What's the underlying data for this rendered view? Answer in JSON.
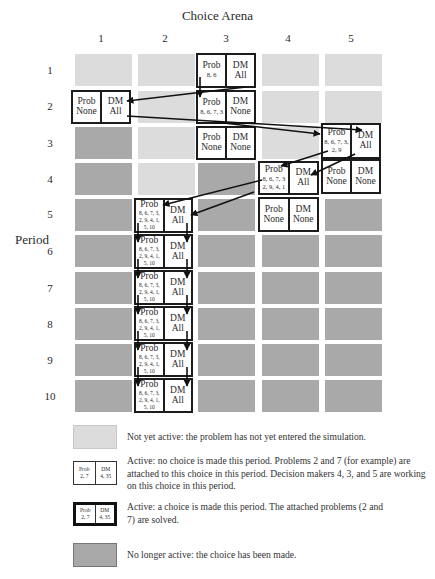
{
  "title": "Choice Arena",
  "axis": {
    "row_label": "Period",
    "columns": [
      "1",
      "2",
      "3",
      "4",
      "5"
    ],
    "rows": [
      "1",
      "2",
      "3",
      "4",
      "5",
      "6",
      "7",
      "8",
      "9",
      "10"
    ]
  },
  "colors": {
    "not_yet_active": "#dcdcdc",
    "no_longer_active": "#a9a9a9",
    "active_fill": "#ffffff",
    "border": "#1c1c1c"
  },
  "cells": [
    {
      "row": 1,
      "col": 3,
      "prob_label": "Prob",
      "prob": "8, 6",
      "dm_label": "DM",
      "dm": "All"
    },
    {
      "row": 2,
      "col": 1,
      "prob_label": "Prob",
      "prob": "None",
      "dm_label": "DM",
      "dm": "All"
    },
    {
      "row": 2,
      "col": 3,
      "prob_label": "Prob",
      "prob": "8, 6, 7, 3",
      "dm_label": "DM",
      "dm": "None"
    },
    {
      "row": 3,
      "col": 3,
      "prob_label": "Prob",
      "prob": "None",
      "dm_label": "DM",
      "dm": "None"
    },
    {
      "row": 3,
      "col": 5,
      "prob_label": "Prob",
      "prob": "8, 6, 7, 3, 2, 9",
      "dm_label": "DM",
      "dm": "All"
    },
    {
      "row": 4,
      "col": 4,
      "prob_label": "Prob",
      "prob": "8, 6, 7, 3 2, 9, 4, 1",
      "dm_label": "DM",
      "dm": "All"
    },
    {
      "row": 4,
      "col": 5,
      "prob_label": "Prob",
      "prob": "None",
      "dm_label": "DM",
      "dm": "None"
    },
    {
      "row": 5,
      "col": 2,
      "prob_label": "Prob",
      "prob": "8, 6, 7, 3, 2, 9, 4, 1, 5, 10",
      "dm_label": "DM",
      "dm": "All"
    },
    {
      "row": 5,
      "col": 4,
      "prob_label": "Prob",
      "prob": "None",
      "dm_label": "DM",
      "dm": "None"
    },
    {
      "row": 6,
      "col": 2,
      "prob_label": "Prob",
      "prob": "8, 6, 7, 3, 2, 9, 4, 1, 5, 10",
      "dm_label": "DM",
      "dm": "All"
    },
    {
      "row": 7,
      "col": 2,
      "prob_label": "Prob",
      "prob": "8, 6, 7, 3, 2, 9, 4, 1, 5, 10",
      "dm_label": "DM",
      "dm": "All"
    },
    {
      "row": 8,
      "col": 2,
      "prob_label": "Prob",
      "prob": "8, 6, 7, 3, 2, 9, 4, 1, 5, 10",
      "dm_label": "DM",
      "dm": "All"
    },
    {
      "row": 9,
      "col": 2,
      "prob_label": "Prob",
      "prob": "8, 6, 7, 3, 2, 9, 4, 1, 5, 10",
      "dm_label": "DM",
      "dm": "All"
    },
    {
      "row": 10,
      "col": 2,
      "prob_label": "Prob",
      "prob": "8, 6, 7, 3, 2, 9, 4, 1, 5, 10",
      "dm_label": "DM",
      "dm": "All"
    }
  ],
  "legend": [
    {
      "type": "not_yet_active",
      "text": "Not yet active: the problem has not yet entered the simulation."
    },
    {
      "type": "active_no_choice",
      "prob_label": "Prob",
      "prob": "2, 7",
      "dm_label": "DM",
      "dm": "4, 35",
      "text": "Active:  no choice is made this period. Problems 2 and 7 (for example) are attached to this choice in this period. Decision makers 4, 3, and 5 are working on this choice in this period."
    },
    {
      "type": "active_choice_made",
      "prob_label": "Prob",
      "prob": "2, 7",
      "dm_label": "DM",
      "dm": "4, 35",
      "text": "Active: a choice is made this period. The attached problems (2 and 7) are solved."
    },
    {
      "type": "no_longer_active",
      "text": "No longer active: the choice has been made."
    }
  ]
}
